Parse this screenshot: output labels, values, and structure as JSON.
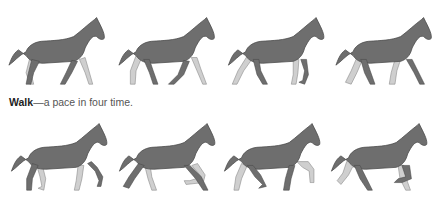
{
  "figure": {
    "caption_term": "Walk",
    "caption_text": "—a pace in four time.",
    "colors": {
      "body": "#6e6e6e",
      "outline": "#4a4a4a",
      "far_leg": "#cfcfcf"
    },
    "rows": [
      {
        "name": "walk",
        "frames": 4
      },
      {
        "name": "trot",
        "frames": 4
      }
    ]
  }
}
